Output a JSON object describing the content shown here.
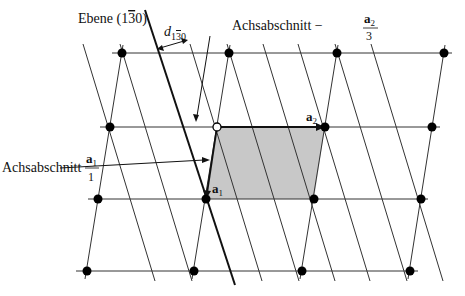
{
  "diagram": {
    "plane_label_prefix": "Ebene (1",
    "plane_label_bar": "3",
    "plane_label_suffix": "0)",
    "d_label": "d",
    "d_sub_1": "1",
    "d_sub_bar": "3",
    "d_sub_0": "0",
    "intercept_a2_text": "Achsabschnitt −",
    "intercept_a2_num": "a",
    "intercept_a2_num_sub": "2",
    "intercept_a2_den": "3",
    "intercept_a1_text": "Achsabschnitt",
    "intercept_a1_num": "a",
    "intercept_a1_num_sub": "1",
    "intercept_a1_den": "1",
    "vec_a1": "a",
    "vec_a1_sub": "1",
    "vec_a2": "a",
    "vec_a2_sub": "2",
    "colors": {
      "line": "#222222",
      "cell_fill": "#c8c8c8",
      "point": "#000000"
    },
    "lattice_rows": [
      {
        "y": 53,
        "x": [
          122,
          229,
          337,
          444
        ]
      },
      {
        "y": 127,
        "x": [
          110,
          217,
          325,
          432
        ]
      },
      {
        "y": 199,
        "x": [
          98,
          206,
          314,
          421
        ]
      },
      {
        "y": 271,
        "x": [
          87,
          194,
          302,
          410
        ]
      }
    ],
    "open_point": {
      "x": 217,
      "y": 127
    }
  }
}
